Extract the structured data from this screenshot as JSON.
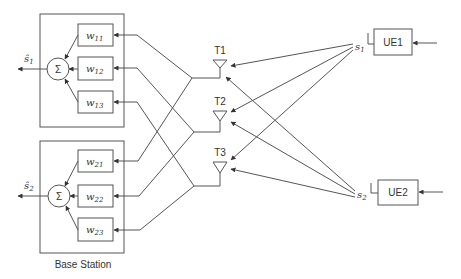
{
  "base_station": {
    "label": "Base Station",
    "combiners": [
      {
        "output_label": "ŝ",
        "output_sub": "1",
        "sum_symbol": "Σ",
        "weights": [
          {
            "w": "w",
            "sub": "11"
          },
          {
            "w": "w",
            "sub": "12"
          },
          {
            "w": "w",
            "sub": "13"
          }
        ]
      },
      {
        "output_label": "ŝ",
        "output_sub": "2",
        "sum_symbol": "Σ",
        "weights": [
          {
            "w": "w",
            "sub": "21"
          },
          {
            "w": "w",
            "sub": "22"
          },
          {
            "w": "w",
            "sub": "23"
          }
        ]
      }
    ]
  },
  "antennas": [
    {
      "label": "T1"
    },
    {
      "label": "T2"
    },
    {
      "label": "T3"
    }
  ],
  "users": [
    {
      "label": "UE1",
      "signal": "s",
      "signal_sub": "1"
    },
    {
      "label": "UE2",
      "signal": "s",
      "signal_sub": "2"
    }
  ]
}
